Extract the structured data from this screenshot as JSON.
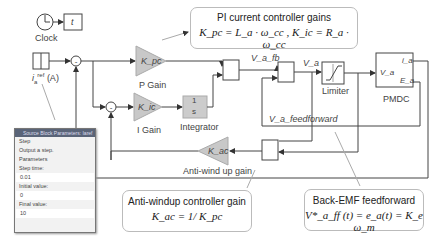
{
  "blocks": {
    "clock": {
      "label": "Clock"
    },
    "display": {
      "label": "t"
    },
    "reference": {
      "label": "i_a^ref (A)",
      "main": "i",
      "sub": "a",
      "sup": "ref",
      "unit": "(A)"
    },
    "p_gain": {
      "gain": "K_pc",
      "label": "P Gain"
    },
    "i_gain": {
      "gain": "K_ic",
      "label": "I Gain"
    },
    "integrator": {
      "num": "1",
      "den": "s",
      "label": "Integrator"
    },
    "antiwindup_gain": {
      "gain": "K_ac",
      "label": "Anti-wind up gain"
    },
    "limiter": {
      "label": "Limiter"
    },
    "pmdc": {
      "label": "PMDC",
      "in": "V_a",
      "out1": "i_a",
      "out2": "E_a"
    }
  },
  "signals": {
    "va_fb": "V_a_fb",
    "va": "V_a",
    "va_feedforward": "V_a_feedforward"
  },
  "callouts": {
    "pi": {
      "title": "PI current controller gains",
      "formula": "K_pc = L_a · ω_cc ,  K_ic = R_a · ω_cc"
    },
    "antiwindup": {
      "title": "Anti-windup controller gain",
      "formula": "K_ac = 1/ K_pc"
    },
    "backemf": {
      "title": "Back-EMF feedforward",
      "formula": "V*_a_ff (t) = e_a(t) = K_e ω_m"
    }
  },
  "dialog": {
    "title": "Source Block Parameters: Iaref",
    "block_type": "Step",
    "description": "Output a step.",
    "section": "Parameters",
    "fields": [
      {
        "label": "Step time:",
        "value": "0.01"
      },
      {
        "label": "Initial value:",
        "value": "0"
      },
      {
        "label": "Final value:",
        "value": "10"
      }
    ]
  }
}
